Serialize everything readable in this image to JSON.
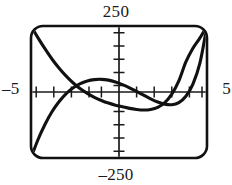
{
  "window": {
    "xmin_label": "–5",
    "xmax_label": "5",
    "ymax_label": "250",
    "ymin_label": "–250"
  },
  "chart_data": {
    "type": "line",
    "title": "",
    "xlabel": "",
    "ylabel": "",
    "xlim": [
      -5,
      5
    ],
    "ylim": [
      -250,
      250
    ],
    "grid": false,
    "legend": "none",
    "x_tick_labels": [
      "-5",
      "5"
    ],
    "y_tick_labels": [
      "250",
      "-250"
    ],
    "x_tick_step": 1,
    "y_tick_step": 50,
    "axis_color": "#1a1a1a",
    "curve_color": "#111111",
    "frame_color": "#111111",
    "series": [
      {
        "name": "quartic",
        "note": "U-shaped curve entering top-left, min below axis near x=1.5, exits top-right",
        "x": [
          -5.0,
          -4.6,
          -4.2,
          -3.8,
          -3.4,
          -3.0,
          -2.6,
          -2.2,
          -1.8,
          -1.4,
          -1.0,
          -0.6,
          -0.2,
          0.2,
          0.6,
          1.0,
          1.4,
          1.8,
          2.2,
          2.6,
          3.0,
          3.4,
          3.8,
          4.2,
          4.6,
          5.0
        ],
        "y": [
          250,
          205,
          163,
          124,
          90,
          60,
          34,
          12,
          -5,
          -20,
          -32,
          -42,
          -50,
          -56,
          -62,
          -66,
          -68,
          -66,
          -58,
          -40,
          -8,
          42,
          114,
          166,
          205,
          250
        ]
      },
      {
        "name": "cubic",
        "note": "S-shaped curve rising from bottom-left, local max near x=-1.5, local min near x=2.5, exits top-right",
        "x": [
          -5.0,
          -4.6,
          -4.2,
          -3.8,
          -3.4,
          -3.0,
          -2.6,
          -2.2,
          -1.8,
          -1.4,
          -1.0,
          -0.6,
          -0.2,
          0.2,
          0.6,
          1.0,
          1.4,
          1.8,
          2.2,
          2.6,
          3.0,
          3.4,
          3.8,
          4.2,
          4.6,
          5.0
        ],
        "y": [
          -250,
          -180,
          -122,
          -74,
          -36,
          -6,
          16,
          32,
          42,
          47,
          48,
          45,
          38,
          28,
          16,
          2,
          -12,
          -26,
          -38,
          -46,
          -48,
          -40,
          -16,
          30,
          110,
          250
        ]
      }
    ]
  }
}
